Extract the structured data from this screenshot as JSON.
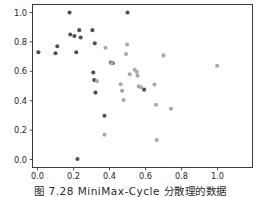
{
  "figure": {
    "caption": "图 7.28  MiniMax-Cycle 分散理的数据",
    "background": "#ffffff"
  },
  "chart_data": {
    "type": "scatter",
    "title": "",
    "xlabel": "",
    "ylabel": "",
    "xlim": [
      -0.05,
      1.05
    ],
    "ylim": [
      -0.06,
      1.06
    ],
    "xticks": [
      0.0,
      0.2,
      0.4,
      0.6,
      0.8,
      1.0
    ],
    "yticks": [
      0.0,
      0.2,
      0.4,
      0.6,
      0.8,
      1.0
    ],
    "xticklabels": [
      "0.0",
      "0.2",
      "0.4",
      "0.6",
      "0.8",
      "1.0"
    ],
    "yticklabels": [
      "0.0",
      "0.2",
      "0.4",
      "0.6",
      "0.8",
      "1.0"
    ],
    "grid": false,
    "legend": false,
    "marker_size": 4.1,
    "series": [
      {
        "name": "group-dark",
        "color": "#4b4f5c",
        "points": [
          [
            0.005,
            0.73
          ],
          [
            0.1,
            0.723
          ],
          [
            0.11,
            0.77
          ],
          [
            0.178,
            1.0
          ],
          [
            0.182,
            0.85
          ],
          [
            0.205,
            0.84
          ],
          [
            0.215,
            0.73
          ],
          [
            0.222,
            0.003
          ],
          [
            0.232,
            0.88
          ],
          [
            0.24,
            0.83
          ],
          [
            0.305,
            0.88
          ],
          [
            0.31,
            0.592
          ],
          [
            0.315,
            0.54
          ],
          [
            0.318,
            0.79
          ],
          [
            0.322,
            0.455
          ],
          [
            0.372,
            0.298
          ],
          [
            0.408,
            0.66
          ],
          [
            0.418,
            0.655
          ],
          [
            0.5,
            1.0
          ],
          [
            0.592,
            0.475
          ]
        ]
      },
      {
        "name": "group-light",
        "color": "#a8a8ac",
        "points": [
          [
            0.33,
            0.533
          ],
          [
            0.372,
            0.168
          ],
          [
            0.378,
            0.76
          ],
          [
            0.412,
            0.655
          ],
          [
            0.462,
            0.512
          ],
          [
            0.47,
            0.468
          ],
          [
            0.478,
            0.405
          ],
          [
            0.492,
            0.718
          ],
          [
            0.498,
            0.782
          ],
          [
            0.512,
            0.58
          ],
          [
            0.54,
            0.61
          ],
          [
            0.552,
            0.595
          ],
          [
            0.556,
            0.57
          ],
          [
            0.562,
            0.498
          ],
          [
            0.575,
            0.492
          ],
          [
            0.65,
            0.51
          ],
          [
            0.658,
            0.372
          ],
          [
            0.662,
            0.133
          ],
          [
            0.7,
            0.708
          ],
          [
            0.742,
            0.345
          ],
          [
            0.998,
            0.638
          ]
        ]
      }
    ]
  },
  "axes": {
    "frame_color": "#3c3c3c",
    "tick_color": "#3c3c3c",
    "label_color": "#262626"
  }
}
